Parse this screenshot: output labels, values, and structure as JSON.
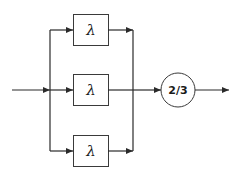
{
  "diagram": {
    "title": "",
    "type": "reliability-block-diagram",
    "blocks": [
      {
        "id": "top",
        "label": "λ"
      },
      {
        "id": "middle",
        "label": "λ"
      },
      {
        "id": "bottom",
        "label": "λ"
      }
    ],
    "voter": {
      "label": "2/3"
    },
    "colors": {
      "stroke": "#2a2a2a",
      "background": "#ffffff"
    }
  }
}
